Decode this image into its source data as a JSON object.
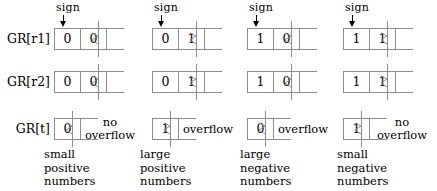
{
  "figure": {
    "type": "diagram",
    "row_labels": [
      "GR[r1]",
      "GR[r2]",
      "GR[t]"
    ],
    "sign_label": "sign",
    "overflow_labels": {
      "none": "no\noverflow",
      "none_line1": "no",
      "none_line2": "overflow",
      "yes": "overflow"
    },
    "colors": {
      "ink": "#000000",
      "box_stroke": "#8d8d8d",
      "background": "#ffffff"
    },
    "columns": [
      {
        "id": "col-1",
        "gr_r1_bits": [
          "0",
          "0"
        ],
        "gr_r2_bits": [
          "0",
          "0"
        ],
        "gr_t_bits": [
          "0"
        ],
        "overflow": "no overflow",
        "overflow_line1": "no",
        "overflow_line2": "overflow",
        "caption_lines": [
          "small",
          "positive",
          "numbers"
        ]
      },
      {
        "id": "col-2",
        "gr_r1_bits": [
          "0",
          "1"
        ],
        "gr_r2_bits": [
          "0",
          "1"
        ],
        "gr_t_bits": [
          "1"
        ],
        "overflow": "overflow",
        "overflow_line1": "overflow",
        "overflow_line2": "",
        "caption_lines": [
          "large",
          "positive",
          "numbers"
        ]
      },
      {
        "id": "col-3",
        "gr_r1_bits": [
          "1",
          "0"
        ],
        "gr_r2_bits": [
          "1",
          "0"
        ],
        "gr_t_bits": [
          "0"
        ],
        "overflow": "overflow",
        "overflow_line1": "overflow",
        "overflow_line2": "",
        "caption_lines": [
          "large",
          "negative",
          "numbers"
        ]
      },
      {
        "id": "col-4",
        "gr_r1_bits": [
          "1",
          "1"
        ],
        "gr_r2_bits": [
          "1",
          "1"
        ],
        "gr_t_bits": [
          "1"
        ],
        "overflow": "no overflow",
        "overflow_line1": "no",
        "overflow_line2": "overflow",
        "caption_lines": [
          "small",
          "negative",
          "numbers"
        ]
      }
    ]
  }
}
